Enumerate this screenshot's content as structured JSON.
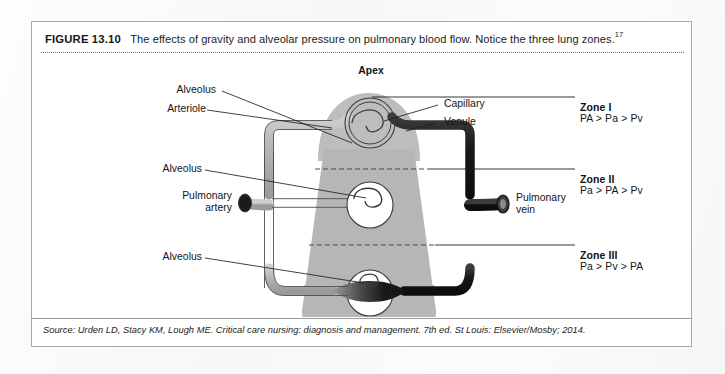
{
  "figure": {
    "number": "FIGURE 13.10",
    "caption": "The effects of gravity and alveolar pressure on pulmonary blood flow. Notice the three lung zones.",
    "superscript": "17",
    "source": "Source: Urden LD, Stacy KM, Lough ME. Critical care nursing: diagnosis and management. 7th ed. St Louis: Elsevier/Mosby; 2014."
  },
  "diagram": {
    "apex_label": "Apex",
    "labels": {
      "alveolus_top": "Alveolus",
      "arteriole": "Arteriole",
      "capillary": "Capillary",
      "venule": "Venule",
      "alveolus_middle": "Alveolus",
      "alveolus_bottom": "Alveolus",
      "pulmonary_artery_line1": "Pulmonary",
      "pulmonary_artery_line2": "artery",
      "pulmonary_vein_line1": "Pulmonary",
      "pulmonary_vein_line2": "vein"
    },
    "zones": [
      {
        "id": "zone-1",
        "title": "Zone I",
        "equation": "PA > Pa > Pv"
      },
      {
        "id": "zone-2",
        "title": "Zone II",
        "equation": "Pa > PA > Pv"
      },
      {
        "id": "zone-3",
        "title": "Zone III",
        "equation": "Pa > Pv > PA"
      }
    ],
    "colors": {
      "lung_fill": "#b6b6b6",
      "lung_apex_fill": "#bdbdbd",
      "arteriole_light": "#b9b9b9",
      "venule_dark": "#17181a",
      "alveolus_white": "#ffffff",
      "outline": "#2b2d2f",
      "leader_line": "#1e2022",
      "frame_border": "#a9a9a9"
    }
  }
}
